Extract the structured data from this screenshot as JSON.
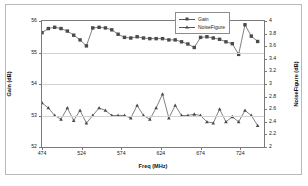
{
  "chart_data": {
    "type": "line",
    "title": "",
    "xlabel": "Freq (MHz)",
    "ylabel": "Gain (dB)",
    "y2label": "NoiseFigure (dB)",
    "xlim": [
      474,
      754
    ],
    "ylim": [
      52,
      56
    ],
    "y2lim": [
      2,
      4
    ],
    "grid": true,
    "legend_position": "top-right",
    "xticks": [
      "474",
      "524",
      "574",
      "624",
      "674",
      "724"
    ],
    "xtick_values": [
      474,
      524,
      574,
      624,
      674,
      724
    ],
    "yticks_left": [
      "52",
      "53",
      "54",
      "55",
      "56"
    ],
    "ytick_left_values": [
      52,
      53,
      54,
      55,
      56
    ],
    "yticks_right": [
      "2",
      "2.2",
      "2.4",
      "2.6",
      "2.8",
      "3",
      "3.2",
      "3.4",
      "3.6",
      "3.8",
      "4"
    ],
    "ytick_right_values": [
      2,
      2.2,
      2.4,
      2.6,
      2.8,
      3,
      3.2,
      3.4,
      3.6,
      3.8,
      4
    ],
    "series": [
      {
        "name": "Gain",
        "axis": "left",
        "color": "#4a4a4a",
        "marker": "square",
        "x": [
          474,
          482,
          490,
          498,
          506,
          514,
          522,
          530,
          538,
          546,
          554,
          562,
          570,
          578,
          586,
          594,
          602,
          610,
          618,
          626,
          634,
          642,
          650,
          658,
          666,
          674,
          682,
          690,
          698,
          706,
          714,
          722,
          730,
          738,
          746
        ],
        "values": [
          55.63,
          55.76,
          55.8,
          55.76,
          55.68,
          55.55,
          55.4,
          55.21,
          55.78,
          55.8,
          55.78,
          55.72,
          55.58,
          55.48,
          55.46,
          55.5,
          55.46,
          55.44,
          55.44,
          55.44,
          55.4,
          55.4,
          55.34,
          55.27,
          55.16,
          55.48,
          55.5,
          55.46,
          55.42,
          55.34,
          55.28,
          54.94,
          55.88,
          55.52,
          55.35
        ]
      },
      {
        "name": "NoiseFigure",
        "axis": "right",
        "color": "#4a4a4a",
        "marker": "triangle",
        "x": [
          474,
          482,
          490,
          498,
          506,
          514,
          522,
          530,
          538,
          546,
          554,
          562,
          570,
          578,
          586,
          594,
          602,
          610,
          618,
          626,
          634,
          642,
          650,
          658,
          666,
          674,
          682,
          690,
          698,
          706,
          714,
          722,
          730,
          738,
          746
        ],
        "values": [
          2.7,
          2.62,
          2.5,
          2.44,
          2.62,
          2.42,
          2.58,
          2.38,
          2.5,
          2.62,
          2.58,
          2.5,
          2.5,
          2.5,
          2.46,
          2.66,
          2.5,
          2.44,
          2.62,
          2.84,
          2.46,
          2.66,
          2.5,
          2.5,
          2.52,
          2.5,
          2.4,
          2.38,
          2.6,
          2.4,
          2.48,
          2.4,
          2.58,
          2.5,
          2.34
        ]
      }
    ],
    "annotations": [
      {
        "name": "gain-axis-arrow",
        "direction": "left",
        "target_axis": "left"
      },
      {
        "name": "noisefigure-axis-arrow",
        "direction": "right",
        "target_axis": "right"
      }
    ]
  },
  "legend": {
    "items": [
      {
        "label": "Gain"
      },
      {
        "label": "NoiseFigure"
      }
    ]
  },
  "colors": {
    "series": "#4a4a4a",
    "axis": "#7a7a7a",
    "grid": "#d2d2d2",
    "annotation": "#6e6e6e",
    "frame": "#b9b9b9"
  }
}
